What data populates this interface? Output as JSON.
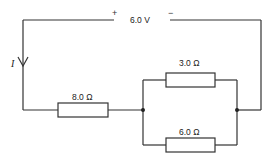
{
  "diagram": {
    "type": "electric-circuit",
    "battery": {
      "voltage_label": "6.0 V",
      "positive_label": "+",
      "negative_label": "−"
    },
    "current": {
      "label": "I",
      "direction": "down"
    },
    "resistors": [
      {
        "id": "r1",
        "label": "8.0 Ω",
        "connection": "series"
      },
      {
        "id": "r2",
        "label": "3.0 Ω",
        "connection": "parallel-top"
      },
      {
        "id": "r3",
        "label": "6.0 Ω",
        "connection": "parallel-bottom"
      }
    ],
    "colors": {
      "wire": "#333333",
      "background": "#ffffff"
    }
  }
}
